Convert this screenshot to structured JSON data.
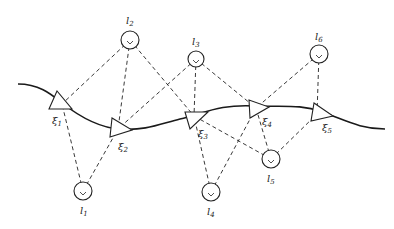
{
  "diagram": {
    "type": "slam-factor-graph",
    "colors": {
      "stroke": "#222222",
      "background": "#ffffff"
    },
    "trajectory": {
      "path": "M18,84 C40,84 52,95 62,103 C80,117 100,128 120,129 C145,131 160,124 180,119 C205,113 220,104 255,106 C285,107 300,104 322,112 C345,120 360,129 385,129"
    },
    "landmarks": [
      {
        "id": "l1",
        "symbol": "l",
        "sub": "1",
        "cx": 83,
        "cy": 191,
        "r": 9,
        "label_x": 80,
        "label_y": 214
      },
      {
        "id": "l2",
        "symbol": "l",
        "sub": "2",
        "cx": 130,
        "cy": 40,
        "r": 9,
        "label_x": 126,
        "label_y": 24
      },
      {
        "id": "l3",
        "symbol": "l",
        "sub": "3",
        "cx": 196,
        "cy": 59,
        "r": 8,
        "label_x": 192,
        "label_y": 45
      },
      {
        "id": "l4",
        "symbol": "l",
        "sub": "4",
        "cx": 211,
        "cy": 192,
        "r": 9,
        "label_x": 207,
        "label_y": 215
      },
      {
        "id": "l5",
        "symbol": "l",
        "sub": "5",
        "cx": 271,
        "cy": 159,
        "r": 9,
        "label_x": 267,
        "label_y": 182
      },
      {
        "id": "l6",
        "symbol": "l",
        "sub": "6",
        "cx": 319,
        "cy": 54,
        "r": 9,
        "label_x": 315,
        "label_y": 40
      }
    ],
    "poses": [
      {
        "id": "xi1",
        "symbol": "ξ",
        "sub": "1",
        "points": "57,91 49,109 72,109",
        "anchor_x": 62,
        "anchor_y": 104,
        "label_x": 52,
        "label_y": 124
      },
      {
        "id": "xi2",
        "symbol": "ξ",
        "sub": "2",
        "points": "112,118 110,137 132,130",
        "anchor_x": 118,
        "anchor_y": 129,
        "label_x": 118,
        "label_y": 150
      },
      {
        "id": "xi3",
        "symbol": "ξ",
        "sub": "3",
        "points": "185,112 190,129 208,112",
        "anchor_x": 194,
        "anchor_y": 116,
        "label_x": 198,
        "label_y": 137
      },
      {
        "id": "xi4",
        "symbol": "ξ",
        "sub": "4",
        "points": "249,100 250,118 269,107",
        "anchor_x": 256,
        "anchor_y": 108,
        "label_x": 262,
        "label_y": 125
      },
      {
        "id": "xi5",
        "symbol": "ξ",
        "sub": "5",
        "points": "314,103 311,121 333,116",
        "anchor_x": 317,
        "anchor_y": 114,
        "label_x": 322,
        "label_y": 131
      }
    ],
    "observations": [
      {
        "from": "l2",
        "to": "xi1"
      },
      {
        "from": "l2",
        "to": "xi2"
      },
      {
        "from": "l2",
        "to": "xi3"
      },
      {
        "from": "l3",
        "to": "xi2"
      },
      {
        "from": "l3",
        "to": "xi3"
      },
      {
        "from": "l3",
        "to": "xi4"
      },
      {
        "from": "l6",
        "to": "xi4"
      },
      {
        "from": "l6",
        "to": "xi5"
      },
      {
        "from": "l1",
        "to": "xi1"
      },
      {
        "from": "l1",
        "to": "xi2"
      },
      {
        "from": "l4",
        "to": "xi3"
      },
      {
        "from": "l4",
        "to": "xi4"
      },
      {
        "from": "l5",
        "to": "xi3"
      },
      {
        "from": "l5",
        "to": "xi4"
      },
      {
        "from": "l5",
        "to": "xi5"
      }
    ]
  }
}
